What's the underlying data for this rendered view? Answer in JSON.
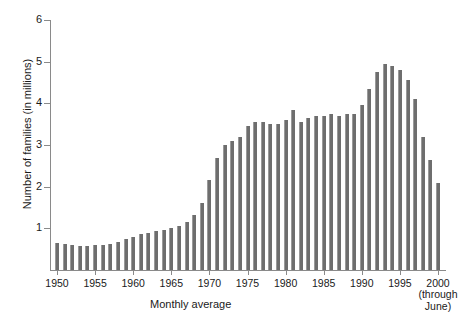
{
  "chart_data": {
    "type": "bar",
    "title": "",
    "subtitle": "",
    "xlabel": "Monthly average",
    "ylabel": "Number of families (in millions)",
    "x_note": "2000\n(through\nJune)",
    "x_note_lines": [
      "2000",
      "(through",
      "June)"
    ],
    "ylim": [
      0,
      6
    ],
    "yticks": [
      1,
      2,
      3,
      4,
      5,
      6
    ],
    "ytick_labels": [
      "1",
      "2",
      "3",
      "4",
      "5",
      "6"
    ],
    "xticks": [
      1950,
      1955,
      1960,
      1965,
      1970,
      1975,
      1980,
      1985,
      1990,
      1995,
      2000
    ],
    "xtick_labels": [
      "1950",
      "1955",
      "1960",
      "1965",
      "1970",
      "1975",
      "1980",
      "1985",
      "1990",
      "1995",
      "2000"
    ],
    "grid": false,
    "legend": null,
    "bar_color": "#6e6e6e",
    "axis_color": "#8a8a8a",
    "categories": [
      "1950",
      "1951",
      "1952",
      "1953",
      "1954",
      "1955",
      "1956",
      "1957",
      "1958",
      "1959",
      "1960",
      "1961",
      "1962",
      "1963",
      "1964",
      "1965",
      "1966",
      "1967",
      "1968",
      "1969",
      "1970",
      "1971",
      "1972",
      "1973",
      "1974",
      "1975",
      "1976",
      "1977",
      "1978",
      "1979",
      "1980",
      "1981",
      "1982",
      "1983",
      "1984",
      "1985",
      "1986",
      "1987",
      "1988",
      "1989",
      "1990",
      "1991",
      "1992",
      "1993",
      "1994",
      "1995",
      "1996",
      "1997",
      "1998",
      "1999",
      "2000"
    ],
    "values": [
      0.65,
      0.62,
      0.6,
      0.57,
      0.58,
      0.6,
      0.61,
      0.62,
      0.68,
      0.75,
      0.79,
      0.87,
      0.9,
      0.93,
      0.95,
      1.0,
      1.05,
      1.15,
      1.33,
      1.62,
      2.16,
      2.7,
      3.0,
      3.1,
      3.2,
      3.45,
      3.55,
      3.55,
      3.5,
      3.5,
      3.6,
      3.85,
      3.55,
      3.65,
      3.7,
      3.7,
      3.75,
      3.7,
      3.75,
      3.75,
      3.95,
      4.35,
      4.75,
      4.95,
      4.9,
      4.8,
      4.55,
      4.1,
      3.2,
      2.65,
      2.1
    ]
  }
}
